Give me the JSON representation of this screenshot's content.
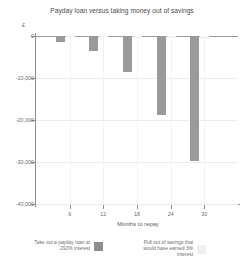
{
  "chart_data": {
    "type": "bar",
    "title": "Payday loan versus taking money out of savings",
    "xlabel": "Months to repay",
    "ylabel": "",
    "y_unit": "£",
    "categories": [
      "6",
      "12",
      "18",
      "24",
      "30"
    ],
    "x": [
      6,
      12,
      18,
      24,
      30
    ],
    "ylim": [
      -40000,
      0
    ],
    "xlim": [
      0,
      36
    ],
    "grid": true,
    "legend_position": "bottom",
    "ytick_labels": [
      "0",
      "-10,000",
      "-20,000",
      "-30,000",
      "-40,000"
    ],
    "ytick_values": [
      0,
      -10000,
      -20000,
      -30000,
      -40000
    ],
    "xtick_labels": [
      "6",
      "12",
      "18",
      "24",
      "30"
    ],
    "series": [
      {
        "name": "Take out a payday loan at 292% interest",
        "color": "#9a9a9a",
        "values": [
          -1400,
          -3600,
          -8600,
          -18900,
          -29700
        ]
      },
      {
        "name": "Pull out of savings that would have earned 3% interest",
        "color": "#f4f4f4",
        "values": [
          -120,
          -250,
          -400,
          -560,
          -720
        ]
      }
    ]
  },
  "legend": {
    "items": [
      {
        "label": "Take out a payday loan at 292% interest",
        "swatch": "#8d8d8d"
      },
      {
        "label": "Pull out of savings that would have earned 3% interest",
        "swatch": "#f0f0f0"
      }
    ]
  },
  "axis": {
    "y_unit_symbol": "£",
    "x_title": "Months to repay"
  }
}
